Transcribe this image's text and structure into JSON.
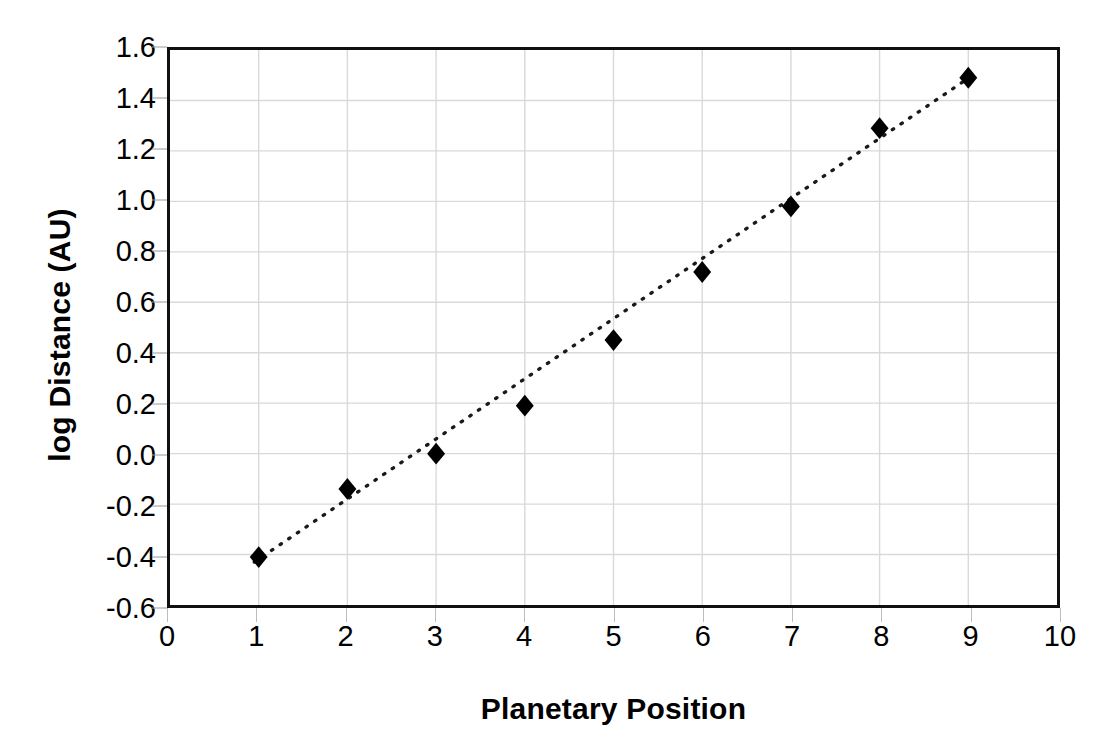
{
  "chart_data": {
    "type": "scatter",
    "title": "",
    "xlabel": "Planetary Position",
    "ylabel": "log Distance (AU)",
    "xlim": [
      0,
      10
    ],
    "ylim": [
      -0.6,
      1.6
    ],
    "xticks": [
      "0",
      "1",
      "2",
      "3",
      "4",
      "5",
      "6",
      "7",
      "8",
      "9",
      "10"
    ],
    "yticks": [
      "1.6",
      "1.4",
      "1.2",
      "1.0",
      "0.8",
      "0.6",
      "0.4",
      "0.2",
      "0.0",
      "-0.2",
      "-0.4",
      "-0.6"
    ],
    "xtick_values": [
      0,
      1,
      2,
      3,
      4,
      5,
      6,
      7,
      8,
      9,
      10
    ],
    "ytick_values": [
      1.6,
      1.4,
      1.2,
      1.0,
      0.8,
      0.6,
      0.4,
      0.2,
      0.0,
      -0.2,
      -0.4,
      -0.6
    ],
    "grid": true,
    "legend": "none",
    "x": [
      1,
      2,
      3,
      4,
      5,
      6,
      7,
      8,
      9
    ],
    "values": [
      -0.41,
      -0.14,
      0.0,
      0.19,
      0.45,
      0.72,
      0.98,
      1.29,
      1.49
    ],
    "series": [
      {
        "name": "log Distance (AU)",
        "marker": "diamond",
        "marker_color": "#000000",
        "x": [
          1,
          2,
          3,
          4,
          5,
          6,
          7,
          8,
          9
        ],
        "values": [
          -0.41,
          -0.14,
          0.0,
          0.19,
          0.45,
          0.72,
          0.98,
          1.29,
          1.49
        ]
      }
    ],
    "trendline": {
      "type": "linear",
      "style": "dotted",
      "color": "#1a1a1a",
      "x_start": 0.95,
      "y_start": -0.43,
      "x_end": 9.05,
      "y_end": 1.5
    },
    "colors": {
      "marker": "#000000",
      "axis": "#101010",
      "grid": "#d9d9d9",
      "background": "#ffffff",
      "text": "#000000"
    }
  }
}
